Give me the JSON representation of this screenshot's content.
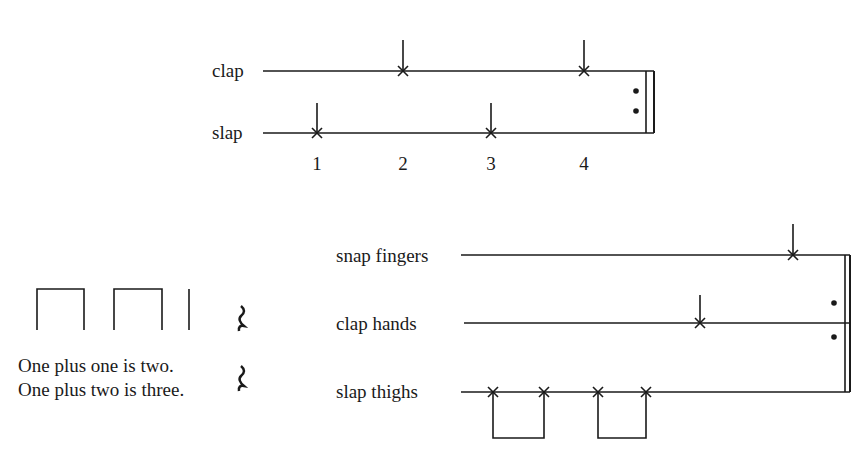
{
  "exercise1": {
    "parts": [
      {
        "label": "clap",
        "beats": [
          2,
          4
        ]
      },
      {
        "label": "slap",
        "beats": [
          1,
          3
        ]
      }
    ],
    "beat_numbers": [
      "1",
      "2",
      "3",
      "4"
    ],
    "ending": "repeat sign"
  },
  "exercise2": {
    "rhythm_text": {
      "line1": "One plus one is two.",
      "line2": "One plus two is three."
    },
    "parts": [
      {
        "label": "snap fingers",
        "notes": "beat 4 (quarter)"
      },
      {
        "label": "clap hands",
        "notes": "beat 3 (quarter)"
      },
      {
        "label": "slap thighs",
        "notes": "two beamed eighth pairs on beats 1-2"
      }
    ],
    "ending": "repeat sign"
  }
}
